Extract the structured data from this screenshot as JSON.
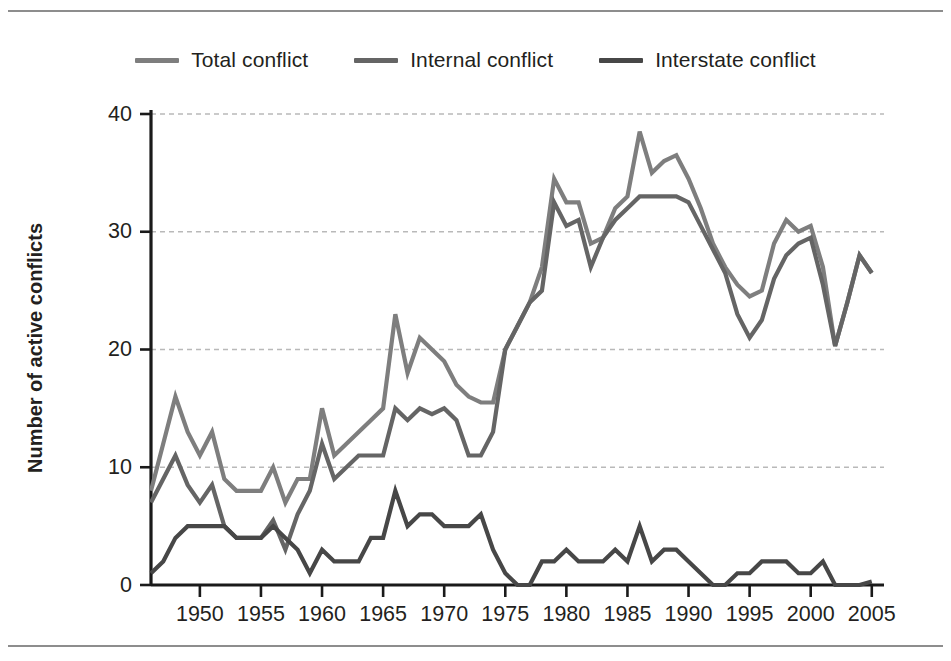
{
  "figure": {
    "ylabel": "Number of active conflicts"
  },
  "legend": {
    "position": "top-center",
    "items": [
      {
        "label": "Total conflict",
        "color": "#7e7e7e",
        "icon": "line-swatch-icon"
      },
      {
        "label": "Internal conflict",
        "color": "#656565",
        "icon": "line-swatch-icon"
      },
      {
        "label": "Interstate conflict",
        "color": "#474747",
        "icon": "line-swatch-icon"
      }
    ]
  },
  "axes": {
    "y_ticks": [
      "0",
      "10",
      "20",
      "30",
      "40"
    ],
    "x_ticks": [
      "1950",
      "1955",
      "1960",
      "1965",
      "1970",
      "1975",
      "1980",
      "1985",
      "1990",
      "1995",
      "2000",
      "2005"
    ]
  },
  "chart_data": {
    "type": "line",
    "title": "",
    "xlabel": "",
    "ylabel": "Number of active conflicts",
    "xlim": [
      1946,
      2006
    ],
    "ylim": [
      0,
      40
    ],
    "grid": true,
    "legend_position": "top-center",
    "x": [
      1946,
      1947,
      1948,
      1949,
      1950,
      1951,
      1952,
      1953,
      1954,
      1955,
      1956,
      1957,
      1958,
      1959,
      1960,
      1961,
      1962,
      1963,
      1964,
      1965,
      1966,
      1967,
      1968,
      1969,
      1970,
      1971,
      1972,
      1973,
      1974,
      1975,
      1976,
      1977,
      1978,
      1979,
      1980,
      1981,
      1982,
      1983,
      1984,
      1985,
      1986,
      1987,
      1988,
      1989,
      1990,
      1991,
      1992,
      1993,
      1994,
      1995,
      1996,
      1997,
      1998,
      1999,
      2000,
      2001,
      2002,
      2003,
      2004,
      2005
    ],
    "series": [
      {
        "name": "Total conflict",
        "color": "#7e7e7e",
        "values": [
          8,
          12,
          16,
          13,
          11,
          13,
          9,
          8,
          8,
          8,
          10,
          7,
          9,
          9,
          15,
          11,
          12,
          13,
          14,
          15,
          23,
          18,
          21,
          20,
          19,
          17,
          16,
          15.5,
          15.5,
          20,
          22,
          24,
          27,
          34.5,
          32.5,
          32.5,
          29,
          29.5,
          32,
          33,
          38.5,
          35,
          36,
          36.5,
          34.5,
          32,
          29,
          27,
          25.5,
          24.5,
          25,
          29,
          31,
          30,
          30.5,
          27,
          20.3,
          24,
          28,
          26.5
        ]
      },
      {
        "name": "Internal conflict",
        "color": "#656565",
        "values": [
          7,
          9,
          11,
          8.5,
          7,
          8.5,
          5,
          4,
          4,
          4,
          5.5,
          3,
          6,
          8,
          12,
          9,
          10,
          11,
          11,
          11,
          15,
          14,
          15,
          14.5,
          15,
          14,
          11,
          11,
          13,
          20,
          22,
          24,
          25,
          32.5,
          30.5,
          31,
          27,
          29.5,
          31,
          32,
          33,
          33,
          33,
          33,
          32.5,
          30.5,
          28.5,
          26.5,
          23,
          21,
          22.5,
          26,
          28,
          29,
          29.5,
          25.5,
          20.3,
          24,
          28,
          26.5
        ]
      },
      {
        "name": "Interstate conflict",
        "color": "#474747",
        "values": [
          1,
          2,
          4,
          5,
          5,
          5,
          5,
          4,
          4,
          4,
          5,
          4,
          3,
          1,
          3,
          2,
          2,
          2,
          4,
          4,
          8,
          5,
          6,
          6,
          5,
          5,
          5,
          6,
          3,
          1,
          0,
          0,
          2,
          2,
          3,
          2,
          2,
          2,
          3,
          2,
          5,
          2,
          3,
          3,
          2,
          1,
          0,
          0,
          1,
          1,
          2,
          2,
          2,
          1,
          1,
          2,
          0,
          0,
          0,
          0.3
        ]
      }
    ]
  }
}
